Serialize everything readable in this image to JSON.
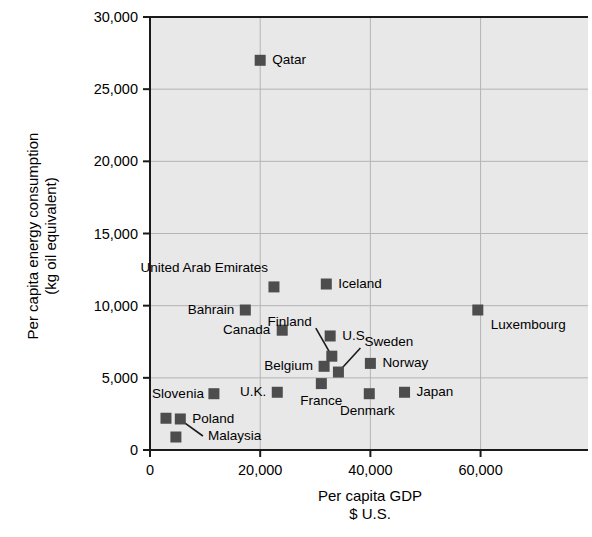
{
  "chart_data": {
    "type": "scatter",
    "title": "",
    "xlabel": "Per capita GDP\n$ U.S.",
    "xlabel_line1": "Per capita GDP",
    "xlabel_line2": "$ U.S.",
    "ylabel": "Per capita energy consumption\n(kg oil equivalent)",
    "ylabel_line1": "Per capita energy consumption",
    "ylabel_line2": "(kg oil equivalent)",
    "xlim": [
      0,
      79500
    ],
    "ylim": [
      0,
      30000
    ],
    "xticks": [
      0,
      20000,
      40000,
      60000
    ],
    "xtick_labels": [
      "0",
      "20,000",
      "40,000",
      "60,000"
    ],
    "yticks": [
      0,
      5000,
      10000,
      15000,
      20000,
      25000,
      30000
    ],
    "ytick_labels": [
      "0",
      "5,000",
      "10,000",
      "15,000",
      "20,000",
      "25,000",
      "30,000"
    ],
    "grid": true,
    "legend": "none",
    "marker_color": "#4d4d4d",
    "plot_background": "#e8e8e8",
    "grid_color": "#b4b4b4",
    "axis_color": "#1a1a1a",
    "points": [
      {
        "name": "Qatar",
        "x": 20000,
        "y": 27000,
        "label": "Qatar",
        "label_pos": "right"
      },
      {
        "name": "Iceland",
        "x": 32000,
        "y": 11500,
        "label": "Iceland",
        "label_pos": "right"
      },
      {
        "name": "United Arab Emirates",
        "x": 22500,
        "y": 11300,
        "label": "United Arab Emirates",
        "label_pos": "above-left"
      },
      {
        "name": "Luxembourg",
        "x": 59500,
        "y": 9700,
        "label": "Luxembourg",
        "label_pos": "below-right"
      },
      {
        "name": "Bahrain",
        "x": 17300,
        "y": 9700,
        "label": "Bahrain",
        "label_pos": "left"
      },
      {
        "name": "Canada",
        "x": 24000,
        "y": 8300,
        "label": "Canada",
        "label_pos": "left"
      },
      {
        "name": "U.S.",
        "x": 32700,
        "y": 7900,
        "label": "U.S.",
        "label_pos": "right"
      },
      {
        "name": "Finland",
        "x": 33000,
        "y": 6500,
        "label": "Finland",
        "label_pos": "leader-up-left"
      },
      {
        "name": "Norway",
        "x": 40000,
        "y": 6000,
        "label": "Norway",
        "label_pos": "right"
      },
      {
        "name": "Belgium",
        "x": 31600,
        "y": 5800,
        "label": "Belgium",
        "label_pos": "left"
      },
      {
        "name": "Sweden",
        "x": 34200,
        "y": 5400,
        "label": "Sweden",
        "label_pos": "leader-up-right"
      },
      {
        "name": "France",
        "x": 31100,
        "y": 4600,
        "label": "France",
        "label_pos": "below"
      },
      {
        "name": "U.K.",
        "x": 23100,
        "y": 4000,
        "label": "U.K.",
        "label_pos": "left"
      },
      {
        "name": "Japan",
        "x": 46200,
        "y": 4000,
        "label": "Japan",
        "label_pos": "right"
      },
      {
        "name": "Denmark",
        "x": 39800,
        "y": 3900,
        "label": "Denmark",
        "label_pos": "below"
      },
      {
        "name": "Slovenia",
        "x": 11600,
        "y": 3900,
        "label": "Slovenia",
        "label_pos": "left"
      },
      {
        "name": "Slovakia",
        "x": 2900,
        "y": 2200,
        "label": "",
        "label_pos": "none"
      },
      {
        "name": "Poland",
        "x": 5500,
        "y": 2150,
        "label": "Poland",
        "label_pos": "right"
      },
      {
        "name": "Malaysia",
        "x": 4700,
        "y": 900,
        "label": "Malaysia",
        "label_pos": "leader-right"
      }
    ],
    "leader_lines": [
      {
        "from": "Finland-label",
        "to": "Finland-marker"
      },
      {
        "from": "Sweden-label",
        "to": "Sweden-marker"
      },
      {
        "from": "Malaysia-label",
        "to": "Malaysia-marker"
      }
    ]
  }
}
